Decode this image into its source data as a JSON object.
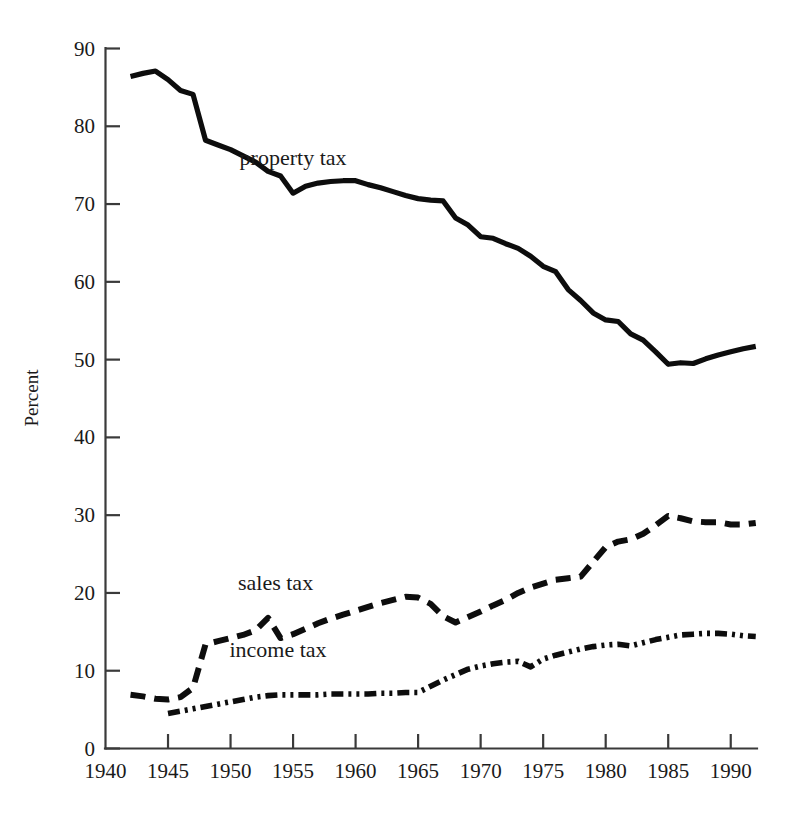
{
  "chart_data": {
    "type": "line",
    "title": "",
    "xlabel": "",
    "ylabel": "Percent",
    "xlim": [
      1940,
      1993.5
    ],
    "ylim": [
      0,
      90
    ],
    "grid": false,
    "legend_position": "inline-labels",
    "x_ticks": [
      1940,
      1945,
      1950,
      1955,
      1960,
      1965,
      1970,
      1975,
      1980,
      1985,
      1990
    ],
    "x_tick_labels": [
      "1940",
      "1945",
      "1950",
      "1955",
      "1960",
      "1965",
      "1970",
      "1975",
      "1980",
      "1985",
      "1990"
    ],
    "y_ticks": [
      0,
      10,
      20,
      30,
      40,
      50,
      60,
      70,
      80,
      90
    ],
    "y_tick_labels": [
      "0",
      "10",
      "20",
      "30",
      "40",
      "50",
      "60",
      "70",
      "80",
      "90"
    ],
    "series": [
      {
        "name": "property tax",
        "label": "property tax",
        "style": "solid",
        "color": "#0d0d0d",
        "label_x": 1955.0,
        "label_y": 75.0,
        "x": [
          1942,
          1943,
          1944,
          1945,
          1946,
          1947,
          1948,
          1949,
          1950,
          1951,
          1952,
          1953,
          1954,
          1955,
          1956,
          1957,
          1958,
          1959,
          1960,
          1961,
          1962,
          1963,
          1964,
          1965,
          1966,
          1967,
          1968,
          1969,
          1970,
          1971,
          1972,
          1973,
          1974,
          1975,
          1976,
          1977,
          1978,
          1979,
          1980,
          1981,
          1982,
          1983,
          1984,
          1985,
          1986,
          1987,
          1988,
          1989,
          1990,
          1991,
          1992
        ],
        "y": [
          86.4,
          86.8,
          87.1,
          86.0,
          84.6,
          84.1,
          78.2,
          77.6,
          77.0,
          76.2,
          75.4,
          74.2,
          73.6,
          71.4,
          72.3,
          72.7,
          72.9,
          73.0,
          73.0,
          72.5,
          72.1,
          71.6,
          71.1,
          70.7,
          70.5,
          70.4,
          68.2,
          67.3,
          65.8,
          65.6,
          64.9,
          64.3,
          63.3,
          62.0,
          61.3,
          59.0,
          57.6,
          56.0,
          55.1,
          54.9,
          53.3,
          52.5,
          51.0,
          49.4,
          49.6,
          49.5,
          50.1,
          50.6,
          51.0,
          51.4,
          51.7
        ]
      },
      {
        "name": "sales tax",
        "label": "sales tax",
        "style": "dashed",
        "color": "#0d0d0d",
        "label_x": 1953.6,
        "label_y": 20.4,
        "x": [
          1942,
          1943,
          1944,
          1945,
          1946,
          1947,
          1948,
          1949,
          1950,
          1951,
          1952,
          1953,
          1954,
          1955,
          1956,
          1957,
          1958,
          1959,
          1960,
          1961,
          1962,
          1963,
          1964,
          1965,
          1966,
          1967,
          1968,
          1969,
          1970,
          1971,
          1972,
          1973,
          1974,
          1975,
          1976,
          1977,
          1978,
          1979,
          1980,
          1981,
          1982,
          1983,
          1984,
          1985,
          1986,
          1987,
          1988,
          1989,
          1990,
          1991,
          1992
        ],
        "y": [
          6.9,
          6.7,
          6.4,
          6.3,
          6.6,
          7.8,
          13.4,
          13.8,
          14.2,
          14.6,
          15.2,
          16.8,
          14.2,
          14.7,
          15.4,
          16.1,
          16.7,
          17.2,
          17.7,
          18.2,
          18.7,
          19.1,
          19.5,
          19.4,
          18.6,
          17.0,
          16.2,
          16.9,
          17.6,
          18.4,
          19.1,
          20.0,
          20.7,
          21.2,
          21.7,
          21.9,
          22.1,
          24.0,
          25.9,
          26.6,
          26.9,
          27.6,
          28.7,
          29.9,
          29.6,
          29.2,
          29.1,
          29.1,
          28.8,
          28.8,
          29.0
        ]
      },
      {
        "name": "income tax",
        "label": "income tax",
        "style": "dashdotdot",
        "color": "#0d0d0d",
        "label_x": 1953.8,
        "label_y": 11.8,
        "x": [
          1945,
          1946,
          1947,
          1948,
          1949,
          1950,
          1951,
          1952,
          1953,
          1954,
          1955,
          1956,
          1957,
          1958,
          1959,
          1960,
          1961,
          1962,
          1963,
          1964,
          1965,
          1966,
          1967,
          1968,
          1969,
          1970,
          1971,
          1972,
          1973,
          1974,
          1975,
          1976,
          1977,
          1978,
          1979,
          1980,
          1981,
          1982,
          1983,
          1984,
          1985,
          1986,
          1987,
          1988,
          1989,
          1990,
          1991,
          1992
        ],
        "y": [
          4.5,
          4.8,
          5.1,
          5.4,
          5.7,
          6.0,
          6.3,
          6.6,
          6.8,
          6.9,
          6.9,
          6.9,
          6.9,
          7.0,
          7.0,
          7.0,
          7.0,
          7.1,
          7.1,
          7.2,
          7.2,
          8.0,
          8.8,
          9.5,
          10.2,
          10.6,
          10.9,
          11.1,
          11.2,
          10.5,
          11.5,
          12.0,
          12.4,
          12.8,
          13.1,
          13.3,
          13.4,
          13.2,
          13.6,
          14.0,
          14.3,
          14.6,
          14.7,
          14.8,
          14.8,
          14.7,
          14.5,
          14.4
        ]
      }
    ]
  },
  "axes": {
    "y_title": "Percent"
  }
}
